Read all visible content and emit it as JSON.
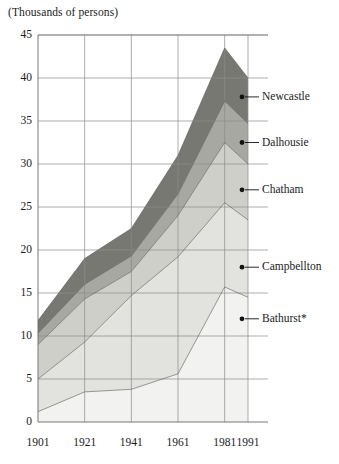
{
  "chart_data": {
    "type": "area",
    "stacked": true,
    "title": "(Thousands of persons)",
    "xlabel": "",
    "ylabel": "",
    "x": [
      1901,
      1921,
      1941,
      1961,
      1981,
      1991
    ],
    "xticklabels": [
      "1901",
      "1921",
      "1941",
      "1961",
      "1981",
      "1991"
    ],
    "yticklabels": [
      "0",
      "5",
      "10",
      "15",
      "20",
      "25",
      "30",
      "35",
      "40",
      "45"
    ],
    "yticks": [
      0,
      5,
      10,
      15,
      20,
      25,
      30,
      35,
      40,
      45
    ],
    "ylim": [
      0,
      45
    ],
    "xlim": [
      1901,
      1991
    ],
    "grid": true,
    "legend_position": "right-inline-labelled",
    "series": [
      {
        "name": "Bathurst*",
        "color": "#f2f2f0",
        "values": [
          1.2,
          3.5,
          3.8,
          5.6,
          15.7,
          14.5
        ]
      },
      {
        "name": "Campbellton",
        "color": "#e2e2de",
        "values": [
          3.8,
          5.8,
          10.9,
          13.6,
          9.8,
          9.0
        ]
      },
      {
        "name": "Chatham",
        "color": "#cfcfca",
        "values": [
          4.0,
          5.0,
          2.8,
          4.8,
          7.0,
          6.5
        ]
      },
      {
        "name": "Dalhousie",
        "color": "#a8a8a3",
        "values": [
          1.3,
          1.7,
          1.8,
          2.5,
          4.8,
          4.7
        ]
      },
      {
        "name": "Newcastle",
        "color": "#787873",
        "values": [
          1.5,
          3.0,
          3.2,
          4.5,
          6.2,
          5.3
        ]
      }
    ],
    "cumulative_tops": {
      "Bathurst*": [
        1.2,
        3.5,
        3.8,
        5.6,
        15.7,
        14.5
      ],
      "Campbellton": [
        5.0,
        9.3,
        14.7,
        19.2,
        25.5,
        23.5
      ],
      "Chatham": [
        9.0,
        14.3,
        17.5,
        24.0,
        32.5,
        30.0
      ],
      "Dalhousie": [
        10.3,
        16.0,
        19.3,
        26.5,
        37.3,
        34.7
      ],
      "Newcastle": [
        11.8,
        19.0,
        22.5,
        31.0,
        43.5,
        40.0
      ]
    },
    "annotations": [
      {
        "name": "Newcastle",
        "label": "Newcastle",
        "y": 37.8
      },
      {
        "name": "Dalhousie",
        "label": "Dalhousie",
        "y": 32.5
      },
      {
        "name": "Chatham",
        "label": "Chatham",
        "y": 27.0
      },
      {
        "name": "Campbellton",
        "label": "Campbellton",
        "y": 18.0
      },
      {
        "name": "Bathurst*",
        "label": "Bathurst*",
        "y": 12.0
      }
    ]
  },
  "axis": {
    "title": "(Thousands of persons)",
    "yticks": [
      "45",
      "40",
      "35",
      "30",
      "25",
      "20",
      "15",
      "10",
      "5",
      "0"
    ],
    "xticks": [
      "1901",
      "1921",
      "1941",
      "1961",
      "1981",
      "1991"
    ]
  },
  "legend": {
    "items": [
      {
        "label": "Newcastle"
      },
      {
        "label": "Dalhousie"
      },
      {
        "label": "Chatham"
      },
      {
        "label": "Campbellton"
      },
      {
        "label": "Bathurst*"
      }
    ]
  }
}
